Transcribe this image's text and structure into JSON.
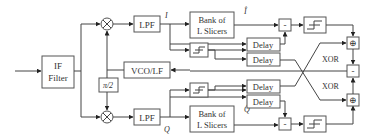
{
  "diagram": {
    "blocks": {
      "if_filter": [
        "IF",
        "Filter"
      ],
      "lpf_top": "LPF",
      "lpf_bottom": "LPF",
      "vco": "VCO/LF",
      "pi2": "π/2",
      "bank_top": [
        "Bank of",
        "L Slicers"
      ],
      "bank_bottom": [
        "Bank of",
        "L Slicers"
      ],
      "delay": "Delay",
      "minus": "-",
      "xor_sum": "⊕",
      "xor_label": "XOR"
    },
    "signals": {
      "i": "I",
      "q": "Q",
      "i_hat": "Î",
      "q_hat": "Q̂"
    }
  }
}
